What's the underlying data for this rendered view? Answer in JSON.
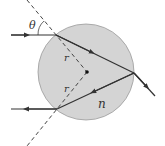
{
  "diagram": {
    "type": "optics-refraction-sphere",
    "labels": {
      "angle_incidence": "θ",
      "angle_refraction_top": "r",
      "angle_refraction_bottom": "r",
      "refractive_index": "n"
    },
    "colors": {
      "sphere_fill": "#d4d4d4",
      "sphere_stroke": "#9a9a9a",
      "ray": "#333333",
      "dashed_line": "#444444",
      "label": "#333333"
    }
  }
}
